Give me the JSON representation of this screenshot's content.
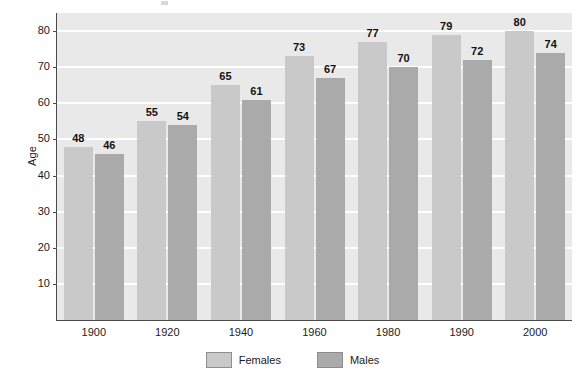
{
  "chart_data": {
    "type": "bar",
    "title": "",
    "subtitle": "",
    "xlabel": "",
    "ylabel": "Age",
    "categories": [
      "1900",
      "1920",
      "1940",
      "1960",
      "1980",
      "1990",
      "2000"
    ],
    "series": [
      {
        "name": "Females",
        "values": [
          48,
          55,
          65,
          73,
          77,
          79,
          80
        ],
        "color": "#c9c9c9"
      },
      {
        "name": "Males",
        "values": [
          46,
          54,
          61,
          67,
          70,
          72,
          74
        ],
        "color": "#aaaaaa"
      }
    ],
    "ylim": [
      0,
      85
    ],
    "yticks": [
      10,
      20,
      30,
      40,
      50,
      60,
      70,
      80
    ],
    "ytick_labels": [
      "10",
      "20",
      "30",
      "40",
      "50",
      "60",
      "70",
      "80"
    ],
    "grid": true,
    "grid_color": "#ffffff",
    "plot_background": "#e9e9e9",
    "legend_position": "bottom-center",
    "data_labels": true
  },
  "legend": {
    "items": [
      {
        "label": "Females"
      },
      {
        "label": "Males"
      }
    ]
  },
  "axis": {
    "y_title": "Age"
  }
}
